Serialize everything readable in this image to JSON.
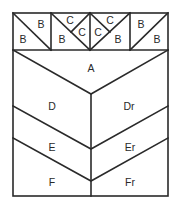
{
  "diagram": {
    "type": "quilt-block-piecing-diagram",
    "stroke_color": "#2a2a2a",
    "top_row": {
      "squares": [
        {
          "position": 1,
          "pieces": [
            "B",
            "B"
          ],
          "diagonal": "top-left to bottom-right"
        },
        {
          "position": 2,
          "pieces": [
            "B",
            "C",
            "C"
          ],
          "diagonal": "top-left to bottom-right with quarter split"
        },
        {
          "position": 3,
          "pieces": [
            "C",
            "C",
            "B"
          ],
          "diagonal": "top-right to bottom-left with quarter split"
        },
        {
          "position": 4,
          "pieces": [
            "B",
            "B"
          ],
          "diagonal": "top-right to bottom-left"
        }
      ]
    },
    "labels": {
      "sq1_upper": "B",
      "sq1_lower": "B",
      "sq2_lower": "B",
      "sq2_top": "C",
      "sq2_right": "C",
      "sq3_left": "C",
      "sq3_top": "C",
      "sq3_lower": "B",
      "sq4_upper": "B",
      "sq4_lower": "B",
      "a": "A",
      "d": "D",
      "dr": "Dr",
      "e": "E",
      "er": "Er",
      "f": "F",
      "fr": "Fr"
    }
  }
}
